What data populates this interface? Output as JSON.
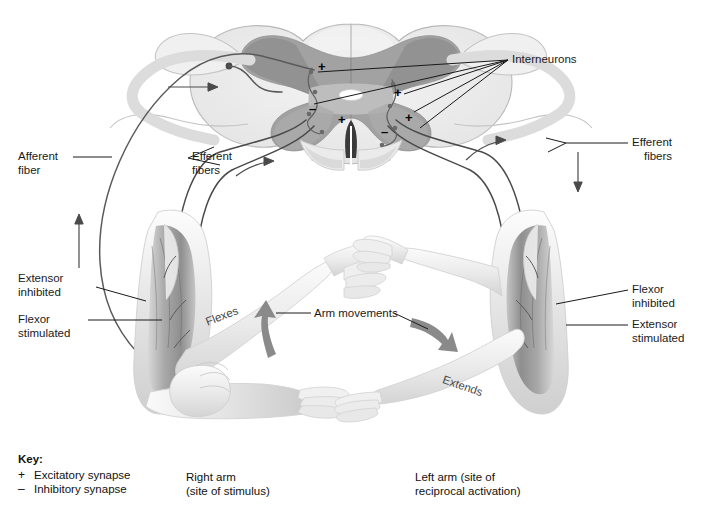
{
  "figure": {
    "background_color": "#ffffff",
    "ink_color": "#1a1a1a"
  },
  "labels": {
    "interneurons": "Interneurons",
    "afferent_fiber": "Afferent\nfiber",
    "efferent_fibers_left": "Efferent\nfibers",
    "efferent_fibers_right": "Efferent\nfibers",
    "extensor_inhibited": "Extensor\ninhibited",
    "flexor_stimulated": "Flexor\nstimulated",
    "flexor_inhibited": "Flexor\ninhibited",
    "extensor_stimulated": "Extensor\nstimulated",
    "arm_movements": "Arm movements",
    "flexes": "Flexes",
    "extends": "Extends"
  },
  "key": {
    "title": "Key:",
    "items": [
      {
        "symbol": "+",
        "label": "Excitatory synapse"
      },
      {
        "symbol": "–",
        "label": "Inhibitory synapse"
      }
    ]
  },
  "captions": {
    "right_arm": "Right arm\n(site of stimulus)",
    "left_arm": "Left arm (site of\nreciprocal activation)"
  },
  "synapse_signs": [
    {
      "id": "left-horn-upper",
      "sign": "+",
      "x": 318,
      "y": 60
    },
    {
      "id": "left-horn-middle",
      "sign": "–",
      "x": 309,
      "y": 102
    },
    {
      "id": "left-horn-lower",
      "sign": "+",
      "x": 338,
      "y": 113
    },
    {
      "id": "right-horn-upper",
      "sign": "+",
      "x": 394,
      "y": 86
    },
    {
      "id": "right-horn-mid",
      "sign": "+",
      "x": 405,
      "y": 111
    },
    {
      "id": "right-horn-lower",
      "sign": "–",
      "x": 381,
      "y": 125
    }
  ],
  "colors": {
    "white_matter": "#e9e9e9",
    "gray_matter": "#9c9c9c",
    "gray_matter_mid": "#bdbdbd",
    "skin": "#e3e3e3",
    "muscle_dark": "#8d8d8d",
    "nerve": "#4a4a4a",
    "leader": "#1a1a1a"
  }
}
